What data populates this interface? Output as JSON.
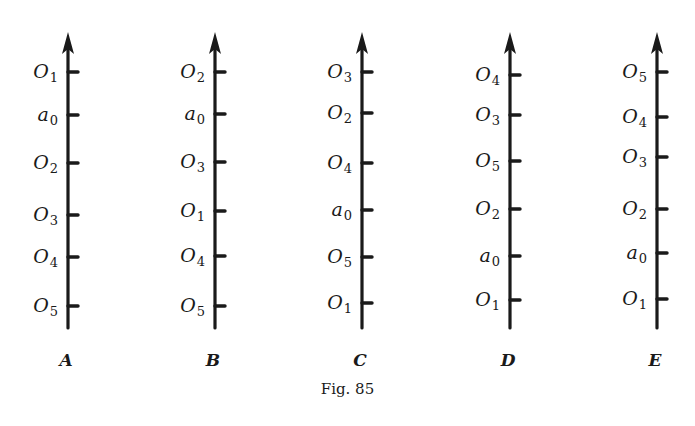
{
  "figure": {
    "caption": "Fig. 85",
    "ink_color": "#1a1a1a",
    "background": "#ffffff",
    "axes": [
      {
        "name": "A",
        "x": 68,
        "ticks": [
          {
            "label": "O",
            "sub": "1",
            "y": 72
          },
          {
            "label": "a",
            "sub": "0",
            "y": 115
          },
          {
            "label": "O",
            "sub": "2",
            "y": 163
          },
          {
            "label": "O",
            "sub": "3",
            "y": 215
          },
          {
            "label": "O",
            "sub": "4",
            "y": 257
          },
          {
            "label": "O",
            "sub": "5",
            "y": 306
          }
        ]
      },
      {
        "name": "B",
        "x": 215,
        "ticks": [
          {
            "label": "O",
            "sub": "2",
            "y": 72
          },
          {
            "label": "a",
            "sub": "0",
            "y": 114
          },
          {
            "label": "O",
            "sub": "3",
            "y": 162
          },
          {
            "label": "O",
            "sub": "1",
            "y": 211
          },
          {
            "label": "O",
            "sub": "4",
            "y": 256
          },
          {
            "label": "O",
            "sub": "5",
            "y": 306
          }
        ]
      },
      {
        "name": "C",
        "x": 362,
        "ticks": [
          {
            "label": "O",
            "sub": "3",
            "y": 72
          },
          {
            "label": "O",
            "sub": "2",
            "y": 113
          },
          {
            "label": "O",
            "sub": "4",
            "y": 163
          },
          {
            "label": "a",
            "sub": "0",
            "y": 210
          },
          {
            "label": "O",
            "sub": "5",
            "y": 257
          },
          {
            "label": "O",
            "sub": "1",
            "y": 303
          }
        ]
      },
      {
        "name": "D",
        "x": 510,
        "ticks": [
          {
            "label": "O",
            "sub": "4",
            "y": 75
          },
          {
            "label": "O",
            "sub": "3",
            "y": 115
          },
          {
            "label": "O",
            "sub": "5",
            "y": 161
          },
          {
            "label": "O",
            "sub": "2",
            "y": 209
          },
          {
            "label": "a",
            "sub": "0",
            "y": 256
          },
          {
            "label": "O",
            "sub": "1",
            "y": 300
          }
        ]
      },
      {
        "name": "E",
        "x": 657,
        "ticks": [
          {
            "label": "O",
            "sub": "5",
            "y": 72
          },
          {
            "label": "O",
            "sub": "4",
            "y": 117
          },
          {
            "label": "O",
            "sub": "3",
            "y": 157
          },
          {
            "label": "O",
            "sub": "2",
            "y": 209
          },
          {
            "label": "a",
            "sub": "0",
            "y": 253
          },
          {
            "label": "O",
            "sub": "1",
            "y": 299
          }
        ]
      }
    ]
  }
}
